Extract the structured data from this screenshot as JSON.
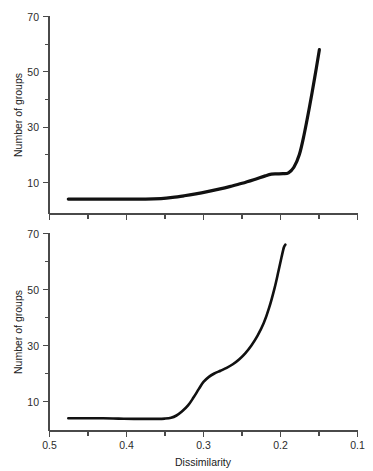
{
  "figure": {
    "background_color": "#ffffff",
    "curve_color": "#111111",
    "axis_color": "#4a4a4a",
    "text_color": "#1a1a1a"
  },
  "chart_data": [
    {
      "type": "line",
      "panel": "top",
      "title": "",
      "xlabel": "",
      "ylabel": "Number of groups",
      "xlim": [
        0.5,
        0.1
      ],
      "ylim": [
        3,
        70
      ],
      "x_axis_reversed": true,
      "grid": false,
      "legend": null,
      "xticks_major": [
        0.5,
        0.4,
        0.3,
        0.2,
        0.1
      ],
      "xticklabels": [
        "",
        "",
        "",
        "",
        ""
      ],
      "xticks_minor": [
        0.45,
        0.35,
        0.25,
        0.15
      ],
      "yticks_major": [
        10,
        30,
        50,
        70
      ],
      "yticklabels": [
        "10",
        "30",
        "50",
        "70"
      ],
      "yticks_minor": [
        20,
        40,
        60
      ],
      "x": [
        0.475,
        0.45,
        0.425,
        0.4,
        0.375,
        0.355,
        0.34,
        0.325,
        0.31,
        0.295,
        0.28,
        0.265,
        0.25,
        0.235,
        0.22,
        0.212,
        0.205,
        0.197,
        0.19,
        0.183,
        0.176,
        0.17,
        0.163,
        0.156,
        0.15
      ],
      "y": [
        4.0,
        4.0,
        4.0,
        4.0,
        4.0,
        4.2,
        4.6,
        5.2,
        5.9,
        6.7,
        7.6,
        8.6,
        9.7,
        11.0,
        12.4,
        13.0,
        13.1,
        13.2,
        13.5,
        15.5,
        20.0,
        27.0,
        37.0,
        48.0,
        58.0
      ]
    },
    {
      "type": "line",
      "panel": "bottom",
      "title": "",
      "xlabel": "Dissimilarity",
      "ylabel": "Number of groups",
      "xlim": [
        0.5,
        0.1
      ],
      "ylim": [
        3,
        70
      ],
      "x_axis_reversed": true,
      "grid": false,
      "legend": null,
      "xticks_major": [
        0.5,
        0.4,
        0.3,
        0.2,
        0.1
      ],
      "xticklabels": [
        "0.5",
        "0.4",
        "0.3",
        "0.2",
        "0.1"
      ],
      "xticks_minor": [
        0.45,
        0.35,
        0.25,
        0.15
      ],
      "yticks_major": [
        10,
        30,
        50,
        70
      ],
      "yticklabels": [
        "10",
        "30",
        "50",
        "70"
      ],
      "yticks_minor": [
        20,
        40,
        60
      ],
      "x": [
        0.475,
        0.45,
        0.43,
        0.41,
        0.39,
        0.375,
        0.36,
        0.35,
        0.342,
        0.335,
        0.328,
        0.32,
        0.313,
        0.306,
        0.3,
        0.293,
        0.286,
        0.278,
        0.27,
        0.262,
        0.254,
        0.246,
        0.238,
        0.23,
        0.222,
        0.215,
        0.208,
        0.203,
        0.199,
        0.196,
        0.194
      ],
      "y": [
        4.0,
        4.0,
        4.0,
        3.9,
        3.8,
        3.8,
        3.8,
        3.9,
        4.2,
        5.0,
        6.4,
        8.6,
        11.4,
        14.5,
        17.0,
        18.8,
        20.0,
        21.0,
        22.0,
        23.3,
        25.0,
        27.2,
        30.0,
        33.5,
        38.0,
        43.5,
        50.5,
        56.5,
        61.5,
        65.0,
        66.0
      ]
    }
  ],
  "labels": {
    "ylabel_top": "Number of groups",
    "ylabel_bottom": "Number of groups",
    "xlabel": "Dissimilarity",
    "ytick_70": "70",
    "ytick_50": "50",
    "ytick_30": "30",
    "ytick_10": "10",
    "xtick_05": "0.5",
    "xtick_04": "0.4",
    "xtick_03": "0.3",
    "xtick_02": "0.2",
    "xtick_01": "0.1"
  }
}
